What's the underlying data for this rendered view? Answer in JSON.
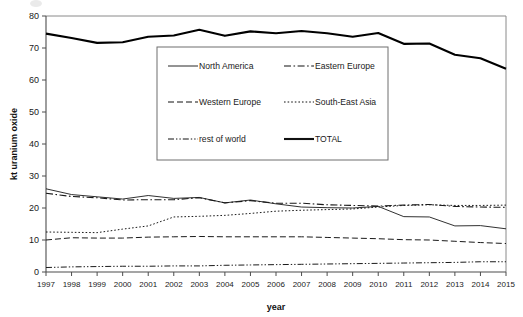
{
  "chart_data": {
    "type": "line",
    "title": "",
    "xlabel": "year",
    "ylabel": "kt uranium oxide",
    "x": [
      1997,
      1998,
      1999,
      2000,
      2001,
      2002,
      2003,
      2004,
      2005,
      2006,
      2007,
      2008,
      2009,
      2010,
      2011,
      2012,
      2013,
      2014,
      2015
    ],
    "categories": [
      "1997",
      "1998",
      "1999",
      "2000",
      "2001",
      "2002",
      "2003",
      "2004",
      "2005",
      "2006",
      "2007",
      "2008",
      "2009",
      "2010",
      "2011",
      "2012",
      "2013",
      "2014",
      "2015"
    ],
    "xlim": [
      1997,
      2015
    ],
    "ylim": [
      0,
      80
    ],
    "yticks": [
      0,
      10,
      20,
      30,
      40,
      50,
      60,
      70,
      80
    ],
    "ytick_labels": [
      "0",
      "10",
      "20",
      "30",
      "40",
      "50",
      "60",
      "70",
      "80"
    ],
    "grid": false,
    "legend_position": "upper-center-inside",
    "series": [
      {
        "name": "North America",
        "style": "solid-thin",
        "color": "#1a1a1a",
        "values": [
          26.0,
          24.2,
          23.5,
          22.8,
          23.9,
          23.0,
          23.3,
          21.6,
          22.5,
          21.3,
          20.3,
          20.1,
          20.0,
          20.5,
          17.3,
          17.2,
          14.4,
          14.5,
          13.5
        ]
      },
      {
        "name": "Eastern Europe",
        "style": "dash-dot",
        "color": "#1a1a1a",
        "values": [
          24.6,
          23.6,
          23.2,
          22.5,
          22.6,
          22.6,
          23.2,
          21.6,
          22.3,
          21.5,
          21.5,
          21.0,
          20.8,
          20.6,
          20.9,
          21.1,
          20.5,
          20.3,
          20.2
        ]
      },
      {
        "name": "Western Europe",
        "style": "dashed",
        "color": "#1a1a1a",
        "values": [
          10.0,
          10.7,
          10.6,
          10.6,
          10.9,
          11.0,
          11.1,
          11.0,
          11.0,
          11.0,
          11.0,
          10.8,
          10.6,
          10.4,
          10.1,
          10.0,
          9.6,
          9.2,
          8.9
        ]
      },
      {
        "name": "South-East Asia",
        "style": "dotted",
        "color": "#1a1a1a",
        "values": [
          12.5,
          12.4,
          12.3,
          13.4,
          14.4,
          17.2,
          17.4,
          17.7,
          18.3,
          19.0,
          19.3,
          19.5,
          19.7,
          20.3,
          20.8,
          21.0,
          20.8,
          20.8,
          20.9
        ]
      },
      {
        "name": "rest of world",
        "style": "dash-dot-dot",
        "color": "#1a1a1a",
        "values": [
          1.4,
          1.6,
          1.7,
          1.8,
          1.8,
          1.9,
          1.9,
          2.1,
          2.2,
          2.3,
          2.4,
          2.5,
          2.6,
          2.7,
          2.8,
          2.9,
          3.0,
          3.2,
          3.2
        ]
      },
      {
        "name": "TOTAL",
        "style": "solid-thick",
        "color": "#000000",
        "values": [
          74.5,
          73.1,
          71.6,
          71.8,
          73.5,
          73.9,
          75.7,
          73.8,
          75.2,
          74.6,
          75.3,
          74.6,
          73.5,
          74.7,
          71.3,
          71.4,
          67.9,
          66.8,
          63.5
        ]
      }
    ],
    "legend_entries": [
      {
        "label": "North America",
        "style": "solid-thin"
      },
      {
        "label": "Eastern Europe",
        "style": "dash-dot"
      },
      {
        "label": "Western Europe",
        "style": "dashed"
      },
      {
        "label": "South-East Asia",
        "style": "dotted"
      },
      {
        "label": "rest of world",
        "style": "dash-dot-dot"
      },
      {
        "label": "TOTAL",
        "style": "solid-thick"
      }
    ]
  }
}
